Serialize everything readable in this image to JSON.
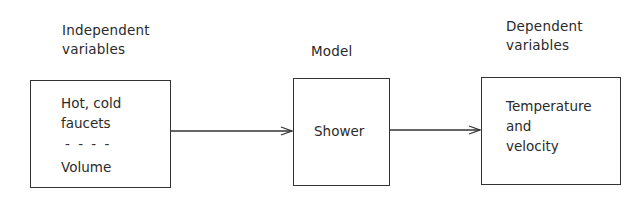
{
  "diagram": {
    "input": {
      "heading_line1": "Independent",
      "heading_line2": "variables",
      "items_line1": "Hot, cold",
      "items_line2": "faucets",
      "separator": "- - - -",
      "items_line3": "Volume"
    },
    "model": {
      "heading": "Model",
      "label": "Shower"
    },
    "output": {
      "heading_line1": "Dependent",
      "heading_line2": "variables",
      "line1": "Temperature",
      "line2": "and",
      "line3": "velocity"
    },
    "edges": [
      {
        "from": "input",
        "to": "model",
        "arrow": "right"
      },
      {
        "from": "model",
        "to": "output",
        "arrow": "right"
      }
    ],
    "colors": {
      "stroke": "#333333",
      "text": "#2a2a2a",
      "background": "#ffffff"
    }
  }
}
